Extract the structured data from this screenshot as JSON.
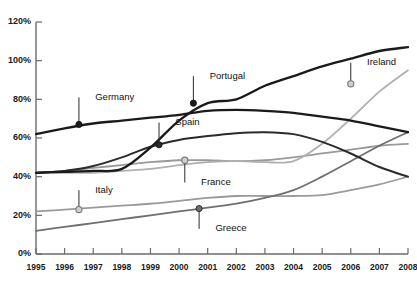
{
  "chart_data": {
    "type": "line",
    "title": "",
    "subtitle": "",
    "xlabel": "",
    "ylabel": "",
    "grid": false,
    "legend_position": "inline-annotations",
    "x": [
      1995,
      1996,
      1997,
      1998,
      1999,
      2000,
      2001,
      2002,
      2003,
      2004,
      2005,
      2006,
      2007,
      2008
    ],
    "xlim": [
      1995,
      2008
    ],
    "ylim": [
      0,
      120
    ],
    "ytick_labels": [
      "0%",
      "20%",
      "40%",
      "60%",
      "80%",
      "100%",
      "120%"
    ],
    "ytick_values": [
      0,
      20,
      40,
      60,
      80,
      100,
      120
    ],
    "xtick_labels": [
      "1995",
      "1996",
      "1997",
      "1998",
      "1999",
      "2000",
      "2001",
      "2002",
      "2003",
      "2004",
      "2005",
      "2006",
      "2007",
      "2008"
    ],
    "series": [
      {
        "name": "Germany",
        "color": "#1a1a1a",
        "width": 2.3,
        "values": [
          62,
          65,
          67.5,
          69,
          70.5,
          72,
          74,
          74.5,
          74,
          73,
          71,
          69,
          66,
          63
        ]
      },
      {
        "name": "Portugal",
        "color": "#1a1a1a",
        "width": 2.3,
        "values": [
          42,
          42.5,
          43,
          44,
          55,
          69,
          78,
          80,
          87,
          92,
          97,
          101,
          105,
          107
        ]
      },
      {
        "name": "Spain",
        "color": "#2b2b2b",
        "width": 2.0,
        "values": [
          42,
          43,
          45.5,
          50,
          55.5,
          59,
          61,
          62.5,
          63,
          62,
          58,
          52,
          45,
          40
        ]
      },
      {
        "name": "Ireland",
        "color": "#b0b0b0",
        "width": 1.8,
        "values": [
          42,
          42,
          42,
          43,
          44,
          46,
          47.5,
          48,
          47.5,
          48,
          57,
          70,
          84,
          95
        ]
      },
      {
        "name": "France",
        "color": "#9a9a9a",
        "width": 1.8,
        "values": [
          42,
          43,
          44.5,
          46,
          47.5,
          48.5,
          48.5,
          48,
          48.5,
          50,
          52,
          54,
          56,
          57
        ]
      },
      {
        "name": "Italy",
        "color": "#9a9a9a",
        "width": 1.8,
        "values": [
          22,
          23,
          24,
          25,
          26,
          27.5,
          29,
          30,
          30,
          30,
          30.5,
          33,
          36,
          40
        ]
      },
      {
        "name": "Greece",
        "color": "#6f6f6f",
        "width": 1.8,
        "values": [
          12,
          14,
          16,
          18,
          20,
          22,
          24,
          26,
          29,
          33,
          40,
          48,
          56,
          63
        ]
      }
    ],
    "annotations": [
      {
        "label": "Germany",
        "x": 1996.5,
        "y": 67.0,
        "marker": "filled",
        "marker_color": "#1a1a1a",
        "text_x": 1997.0,
        "text_y": 81.0
      },
      {
        "label": "Portugal",
        "x": 2000.5,
        "y": 78.0,
        "marker": "filled",
        "marker_color": "#1a1a1a",
        "text_x": 2001.0,
        "text_y": 92.0
      },
      {
        "label": "Spain",
        "x": 1999.3,
        "y": 56.5,
        "marker": "filled",
        "marker_color": "#2b2b2b",
        "text_x": 1999.8,
        "text_y": 68.0
      },
      {
        "label": "France",
        "x": 2000.2,
        "y": 48.5,
        "marker": "open",
        "marker_color": "#9a9a9a",
        "text_x": 2000.7,
        "text_y": 37.0
      },
      {
        "label": "Ireland",
        "x": 2006.0,
        "y": 88.0,
        "marker": "open",
        "marker_color": "#9a9a9a",
        "text_x": 2006.5,
        "text_y": 99.0
      },
      {
        "label": "Italy",
        "x": 1996.5,
        "y": 23.0,
        "marker": "open",
        "marker_color": "#9a9a9a",
        "text_x": 1997.0,
        "text_y": 33.0
      },
      {
        "label": "Greece",
        "x": 2000.7,
        "y": 23.5,
        "marker": "filled",
        "marker_color": "#6f6f6f",
        "text_x": 2001.2,
        "text_y": 13.0
      }
    ]
  },
  "axes": {
    "y_axis_name": "percent-axis",
    "x_axis_name": "year-axis"
  }
}
